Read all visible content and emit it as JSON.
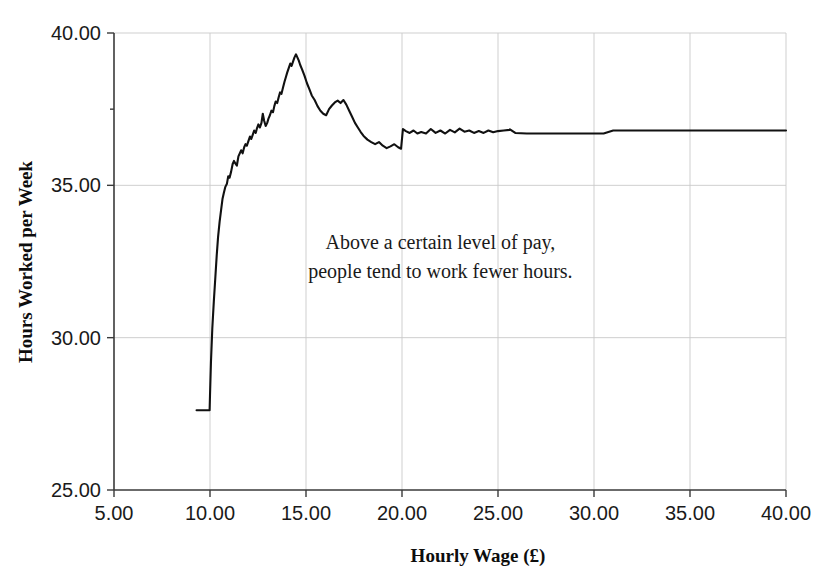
{
  "chart_data": {
    "type": "line",
    "title": "",
    "xlabel": "Hourly Wage (£)",
    "ylabel": "Hours Worked per Week",
    "xlim": [
      5.0,
      40.0
    ],
    "ylim": [
      25.0,
      40.0
    ],
    "grid": true,
    "legend": "none",
    "line_color": "#111111",
    "xticks": [
      5.0,
      10.0,
      15.0,
      20.0,
      25.0,
      30.0,
      35.0,
      40.0
    ],
    "xtick_labels": [
      "5.00",
      "10.00",
      "15.00",
      "20.00",
      "25.00",
      "30.00",
      "35.00",
      "40.00"
    ],
    "yticks": [
      25.0,
      30.0,
      35.0,
      40.0
    ],
    "ytick_labels": [
      "25.00",
      "30.00",
      "35.00",
      "40.00"
    ],
    "annotations": [
      {
        "name": "insight-note",
        "lines": [
          "Above a certain level of pay,",
          "people tend to work fewer hours."
        ],
        "x": 22.0,
        "y": 32.9
      }
    ],
    "series": [
      {
        "name": "Hours worked vs hourly wage",
        "x": [
          9.3,
          9.6,
          9.85,
          9.98,
          10.0,
          10.05,
          10.12,
          10.2,
          10.28,
          10.35,
          10.42,
          10.5,
          10.58,
          10.65,
          10.72,
          10.8,
          10.88,
          10.95,
          11.02,
          11.1,
          11.18,
          11.25,
          11.32,
          11.4,
          11.48,
          11.55,
          11.62,
          11.7,
          11.78,
          11.85,
          11.92,
          12.0,
          12.08,
          12.15,
          12.22,
          12.3,
          12.38,
          12.45,
          12.52,
          12.6,
          12.68,
          12.75,
          12.82,
          12.9,
          12.98,
          13.05,
          13.12,
          13.2,
          13.28,
          13.35,
          13.42,
          13.5,
          13.58,
          13.65,
          13.72,
          13.8,
          13.88,
          13.95,
          14.02,
          14.1,
          14.18,
          14.25,
          14.32,
          14.4,
          14.48,
          14.55,
          14.62,
          14.7,
          14.8,
          14.92,
          15.05,
          15.18,
          15.3,
          15.45,
          15.6,
          15.75,
          15.9,
          16.05,
          16.2,
          16.35,
          16.5,
          16.65,
          16.8,
          16.95,
          17.1,
          17.25,
          17.4,
          17.55,
          17.7,
          17.85,
          18.0,
          18.2,
          18.4,
          18.6,
          18.8,
          19.0,
          19.2,
          19.4,
          19.6,
          19.8,
          19.95,
          20.05,
          20.2,
          20.4,
          20.6,
          20.8,
          21.0,
          21.25,
          21.5,
          21.75,
          22.0,
          22.25,
          22.5,
          22.75,
          23.0,
          23.25,
          23.5,
          23.75,
          24.0,
          24.25,
          24.5,
          24.75,
          25.0,
          25.3,
          25.6,
          25.62,
          25.9,
          26.5,
          27.5,
          28.5,
          29.5,
          30.5,
          31.0,
          33.0,
          35.0,
          37.0,
          40.0
        ],
        "y": [
          27.62,
          27.62,
          27.62,
          27.62,
          28.1,
          29.2,
          30.3,
          31.2,
          32.0,
          32.7,
          33.3,
          33.8,
          34.2,
          34.55,
          34.75,
          34.95,
          35.05,
          35.3,
          35.25,
          35.45,
          35.7,
          35.8,
          35.72,
          35.65,
          35.95,
          36.05,
          36.15,
          36.05,
          36.25,
          36.35,
          36.3,
          36.45,
          36.6,
          36.52,
          36.65,
          36.8,
          36.72,
          36.88,
          37.0,
          36.9,
          37.05,
          37.35,
          37.12,
          36.95,
          37.05,
          37.2,
          37.3,
          37.45,
          37.4,
          37.6,
          37.75,
          37.7,
          37.9,
          38.05,
          38.0,
          38.2,
          38.4,
          38.55,
          38.7,
          38.85,
          39.0,
          38.92,
          39.05,
          39.2,
          39.3,
          39.2,
          39.1,
          38.95,
          38.8,
          38.6,
          38.35,
          38.15,
          37.95,
          37.8,
          37.6,
          37.45,
          37.35,
          37.3,
          37.5,
          37.62,
          37.72,
          37.78,
          37.7,
          37.8,
          37.65,
          37.45,
          37.25,
          37.05,
          36.9,
          36.75,
          36.62,
          36.5,
          36.42,
          36.35,
          36.42,
          36.3,
          36.22,
          36.28,
          36.35,
          36.25,
          36.2,
          36.85,
          36.78,
          36.72,
          36.8,
          36.7,
          36.75,
          36.7,
          36.85,
          36.72,
          36.8,
          36.7,
          36.82,
          36.74,
          36.86,
          36.76,
          36.8,
          36.72,
          36.78,
          36.72,
          36.8,
          36.74,
          36.78,
          36.8,
          36.82,
          36.84,
          36.72,
          36.7,
          36.7,
          36.7,
          36.7,
          36.7,
          36.8,
          36.8,
          36.8,
          36.8,
          36.8
        ]
      }
    ]
  }
}
